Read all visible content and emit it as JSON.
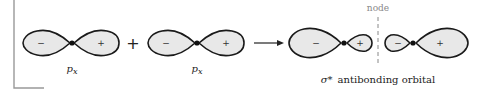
{
  "figure": {
    "reactants": [
      {
        "name": "p_x orbital 1",
        "label": "p",
        "subscript": "x",
        "lobes": [
          {
            "sign": "−"
          },
          {
            "sign": "+"
          }
        ]
      },
      {
        "name": "p_x orbital 2",
        "label": "p",
        "subscript": "x",
        "lobes": [
          {
            "sign": "−"
          },
          {
            "sign": "+"
          }
        ]
      }
    ],
    "operator": "+",
    "product": {
      "label_symbol": "σ*",
      "label_text": "antibonding orbital",
      "left_atom": {
        "lobes": [
          {
            "sign": "−"
          },
          {
            "sign": "+"
          }
        ]
      },
      "right_atom": {
        "lobes": [
          {
            "sign": "−"
          },
          {
            "sign": "+"
          }
        ]
      },
      "node_label": "node"
    },
    "colors": {
      "lobe_fill": "#e8e8e8",
      "outline": "#1a1a1a",
      "node_line": "#888888",
      "frame": "#999999"
    }
  }
}
